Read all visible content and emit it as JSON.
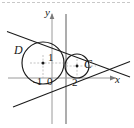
{
  "figure": {
    "kind": "geometry-diagram",
    "background_color": "#ffffff",
    "stroke_color": "#1a1a1a",
    "axis_color": "#9a9a9a",
    "guide_color": "#b4b4b4"
  },
  "axes": {
    "x_label": "x",
    "y_label": "y",
    "x_axis_y_px": 78,
    "y_axis_x_px": 52,
    "tick_labels": {
      "neg_one": "-1",
      "zero": "0",
      "two": "2"
    }
  },
  "circles": [
    {
      "name": "D",
      "label": "D",
      "center_px": [
        43,
        63
      ],
      "radius_px": 21,
      "center_dot": true,
      "center_value_label": "1"
    },
    {
      "name": "C",
      "label": "C",
      "center_px": [
        77,
        66
      ],
      "radius_px": 12,
      "center_dot": true,
      "center_value_label": ""
    }
  ],
  "lines": {
    "upper_tangent": {
      "from_px": [
        8,
        32
      ],
      "to_px": [
        128,
        76
      ]
    },
    "lower_tangent": {
      "from_px": [
        14,
        106
      ],
      "to_px": [
        128,
        62
      ]
    },
    "vertical_gray": {
      "from_px": [
        52,
        14
      ],
      "to_px": [
        52,
        124
      ]
    },
    "vertical_dark": {
      "from_px": [
        66,
        14
      ],
      "to_px": [
        66,
        124
      ]
    },
    "horizontal_guide_D": {
      "from_px": [
        30,
        63
      ],
      "to_px": [
        68,
        63
      ]
    },
    "horizontal_guide_C": {
      "from_px": [
        66,
        66
      ],
      "to_px": [
        95,
        66
      ]
    },
    "vertical_guide_D": {
      "from_px": [
        43,
        55
      ],
      "to_px": [
        43,
        78
      ]
    },
    "vertical_guide_C": {
      "from_px": [
        77,
        60
      ],
      "to_px": [
        77,
        78
      ]
    }
  },
  "top_border": {
    "present": true,
    "style": "dashed",
    "color": "#c8c8c8"
  }
}
